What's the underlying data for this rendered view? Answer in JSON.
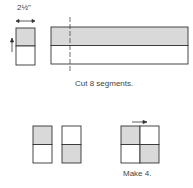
{
  "diagram": {
    "measurement_label": "2½\"",
    "cut_caption": "Cut 8 segments.",
    "make_caption": "Make 4.",
    "colors": {
      "shaded": "#d9d9d9",
      "line": "#333333",
      "background": "#ffffff"
    }
  }
}
